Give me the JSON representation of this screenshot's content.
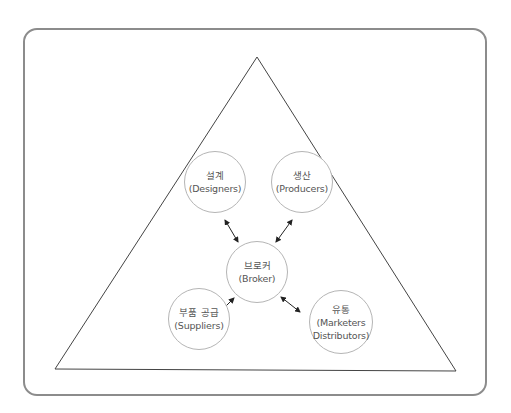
{
  "diagram": {
    "colors": {
      "frame_border": "#8c8c8c",
      "triangle_stroke": "#444444",
      "circle_stroke": "#b5b5b5",
      "arrow": "#222222",
      "text": "#555555"
    },
    "nodes": {
      "designers": {
        "ko": "설계",
        "en": "(Designers)"
      },
      "producers": {
        "ko": "생산",
        "en": "(Producers)"
      },
      "broker": {
        "ko": "브로커",
        "en": "(Broker)"
      },
      "suppliers": {
        "ko": "부품 공급",
        "en": "(Suppliers)"
      },
      "marketers": {
        "ko": "유통",
        "en": "(Marketers",
        "en2": "Distributors)"
      }
    },
    "edges": [
      {
        "from": "broker",
        "to": "designers",
        "type": "bidirectional"
      },
      {
        "from": "broker",
        "to": "producers",
        "type": "bidirectional"
      },
      {
        "from": "broker",
        "to": "suppliers",
        "type": "bidirectional"
      },
      {
        "from": "broker",
        "to": "marketers",
        "type": "bidirectional"
      }
    ]
  }
}
